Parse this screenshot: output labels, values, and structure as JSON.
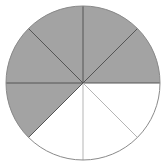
{
  "diagram": {
    "type": "fraction-circle",
    "total_sectors": 8,
    "shaded_sectors": 5,
    "unshaded_sectors": 3,
    "fraction_shaded": "5/8",
    "center": [
      83,
      83
    ],
    "radius": 77,
    "colors": {
      "shaded_fill": "#a3a3a3",
      "unshaded_fill": "#ffffff",
      "shaded_stroke": "#555555",
      "unshaded_stroke": "#b5b5b5",
      "outline": "#8a8a8a"
    },
    "sectors": [
      {
        "index": 0,
        "from_deg": 0,
        "to_deg": 45,
        "shaded": false
      },
      {
        "index": 1,
        "from_deg": 45,
        "to_deg": 90,
        "shaded": false
      },
      {
        "index": 2,
        "from_deg": 90,
        "to_deg": 135,
        "shaded": false
      },
      {
        "index": 3,
        "from_deg": 135,
        "to_deg": 180,
        "shaded": true
      },
      {
        "index": 4,
        "from_deg": 180,
        "to_deg": 225,
        "shaded": true
      },
      {
        "index": 5,
        "from_deg": 225,
        "to_deg": 270,
        "shaded": true
      },
      {
        "index": 6,
        "from_deg": 270,
        "to_deg": 315,
        "shaded": true
      },
      {
        "index": 7,
        "from_deg": 315,
        "to_deg": 360,
        "shaded": true
      }
    ]
  }
}
